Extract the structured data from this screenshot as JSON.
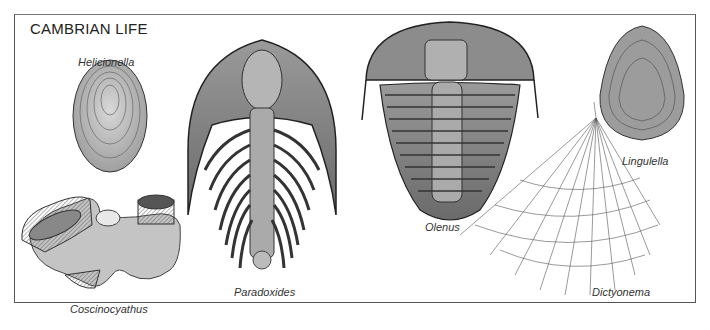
{
  "plate": {
    "title": "CAMBRIAN LIFE"
  },
  "specimens": [
    {
      "name": "Helicionella"
    },
    {
      "name": "Coscinocyathus"
    },
    {
      "name": "Paradoxides"
    },
    {
      "name": "Olenus"
    },
    {
      "name": "Dictyonema"
    },
    {
      "name": "Lingulella"
    }
  ],
  "colors": {
    "frame": "#555555",
    "ink": "#222222",
    "shading": "#8a8a8a"
  }
}
